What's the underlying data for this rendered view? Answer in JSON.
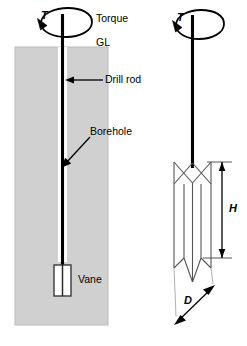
{
  "figure": {
    "background_color": "#ffffff",
    "line_color": "#000000",
    "soil_fill_color": "#d0d0d0",
    "soil_stroke_color": "#b4b4b4"
  },
  "left_diagram": {
    "name": "vane-test-in-borehole",
    "torque_symbol": "T",
    "torque_label": "Torque",
    "ground_level_label": "GL",
    "drill_rod_label": "Drill rod",
    "borehole_label": "Borehole",
    "vane_label": "Vane"
  },
  "right_diagram": {
    "name": "vane-geometry-detail",
    "torque_symbol": "T",
    "height_label": "H",
    "diameter_label": "D",
    "blade_count": 4
  }
}
